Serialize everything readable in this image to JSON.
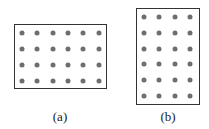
{
  "figures": [
    {
      "id": "a",
      "caption": "(a)",
      "columns": 6,
      "rows": 4,
      "box": {
        "x": 14,
        "y": 24,
        "w": 93,
        "h": 65
      },
      "dot_origin": {
        "x": 22,
        "y": 33
      },
      "dot_spacing": {
        "x": 15.3,
        "y": 16
      },
      "caption_pos": {
        "x": 60,
        "y": 109
      }
    },
    {
      "id": "b",
      "caption": "(b)",
      "columns": 4,
      "rows": 6,
      "box": {
        "x": 136,
        "y": 8,
        "w": 64,
        "h": 97
      },
      "dot_origin": {
        "x": 144,
        "y": 17
      },
      "dot_spacing": {
        "x": 15.3,
        "y": 15.8
      },
      "caption_pos": {
        "x": 168,
        "y": 109
      }
    }
  ],
  "colors": {
    "dot": "#6e6e6e",
    "border": "#333333"
  }
}
